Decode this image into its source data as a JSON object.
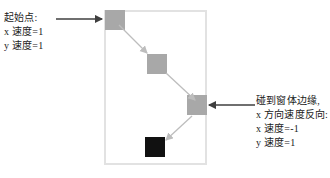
{
  "diagram": {
    "window_frame": {
      "label": "窗体",
      "x": 104,
      "y": 10,
      "width": 103,
      "height": 155,
      "border_color": "#e2e2e2"
    },
    "ball_color": "#a8a8a8",
    "final_ball_color": "#111111",
    "arrow_color": "#bfbfbf",
    "pointer_color": "#4a4a4a",
    "balls": [
      {
        "name": "ball-start",
        "x": 105,
        "y": 10,
        "size": 20,
        "color": "#a8a8a8"
      },
      {
        "name": "ball-step-2",
        "x": 147,
        "y": 54,
        "size": 20,
        "color": "#a8a8a8"
      },
      {
        "name": "ball-at-edge",
        "x": 187,
        "y": 95,
        "size": 20,
        "color": "#a8a8a8"
      },
      {
        "name": "ball-after-bounce",
        "x": 145,
        "y": 137,
        "size": 20,
        "color": "#111111"
      }
    ],
    "annotations": {
      "start": {
        "name": "start-point-annotation",
        "lines": [
          "起始点:",
          "x 速度=1",
          "y 速度=1"
        ]
      },
      "bounce": {
        "name": "edge-bounce-annotation",
        "lines": [
          "碰到窗体边缘,",
          "x 方向速度反向:",
          "x 速度=-1",
          "y 速度=1"
        ]
      }
    },
    "pointers": [
      {
        "name": "pointer-to-start-ball",
        "direction": "right",
        "from_x": 56,
        "to_x": 104,
        "y": 19
      },
      {
        "name": "pointer-to-edge-ball",
        "direction": "left",
        "from_x": 255,
        "to_x": 207,
        "y": 105
      }
    ],
    "motion_arrows": [
      {
        "name": "motion-arrow-1",
        "x1": 119,
        "y1": 25,
        "x2": 148,
        "y2": 54
      },
      {
        "name": "motion-arrow-2",
        "x1": 166,
        "y1": 73,
        "x2": 196,
        "y2": 101
      },
      {
        "name": "motion-arrow-3",
        "x1": 192,
        "y1": 116,
        "x2": 164,
        "y2": 142
      }
    ]
  }
}
